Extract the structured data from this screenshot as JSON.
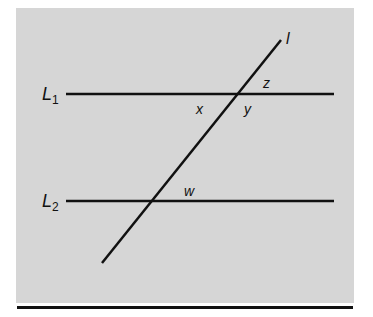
{
  "diagram": {
    "lines": {
      "L1": {
        "label": "L",
        "subscript": "1"
      },
      "L2": {
        "label": "L",
        "subscript": "2"
      },
      "transversal": {
        "label": "l"
      }
    },
    "angles": {
      "x": "x",
      "y": "y",
      "z": "z",
      "w": "w"
    },
    "colors": {
      "panel": "#d6d6d6",
      "line": "#111111"
    }
  }
}
